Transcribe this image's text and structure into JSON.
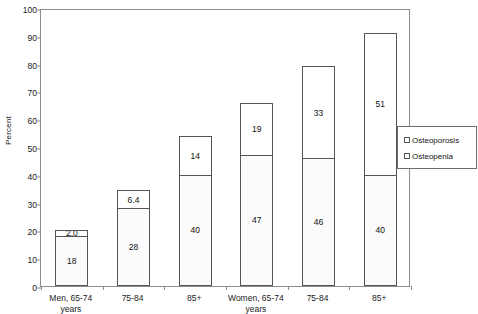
{
  "chart_data": {
    "type": "bar",
    "title": "",
    "xlabel": "",
    "ylabel": "Percent",
    "ylim": [
      0,
      100
    ],
    "ytick_step": 10,
    "yticks": [
      0,
      10,
      20,
      30,
      40,
      50,
      60,
      70,
      80,
      90,
      100
    ],
    "grid": false,
    "stacked": true,
    "legend_position": "right",
    "categories": [
      "Men, 65-74\nyears",
      "75-84",
      "85+",
      "Women, 65-74\nyears",
      "75-84",
      "85+"
    ],
    "series": [
      {
        "name": "Osteopenia",
        "fill": "dotted",
        "values": [
          18,
          28,
          40,
          47,
          46,
          40
        ],
        "labels": [
          "18",
          "28",
          "40",
          "47",
          "46",
          "40"
        ]
      },
      {
        "name": "Osteoporosis",
        "fill": "white",
        "values": [
          2.0,
          6.4,
          14,
          19,
          33,
          51
        ],
        "labels": [
          "2.0",
          "6.4",
          "14",
          "19",
          "33",
          "51"
        ]
      }
    ],
    "totals": [
      20.0,
      34.4,
      54,
      66,
      79,
      91
    ]
  },
  "legend": {
    "items": [
      {
        "label": "Osteoporosis",
        "swatch": "osteoporosis"
      },
      {
        "label": "Osteopenia",
        "swatch": "osteopenia"
      }
    ]
  },
  "colors": {
    "axis": "#8c8c8c",
    "bar_border": "#555555",
    "osteoporosis_fill": "#ffffff",
    "osteopenia_dot": "#9a9a9a",
    "text": "#1a1a1a"
  }
}
